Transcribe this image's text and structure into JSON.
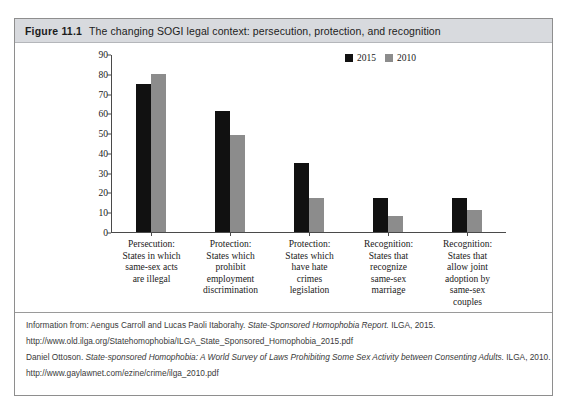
{
  "figure": {
    "number": "Figure 11.1",
    "title": "The changing SOGI legal context: persecution, protection, and recognition"
  },
  "chart_data": {
    "type": "bar",
    "title": "The changing SOGI legal context: persecution, protection, and recognition",
    "xlabel": "",
    "ylabel": "",
    "ylim": [
      0,
      90
    ],
    "yticks": [
      0,
      10,
      20,
      30,
      40,
      50,
      60,
      70,
      80,
      90
    ],
    "grid": false,
    "legend_position": "top-right",
    "categories": [
      "Persecution: States in which same-sex acts are illegal",
      "Protection: States which prohibit employment discrimination",
      "Protection: States which have hate crimes legislation",
      "Recognition: States that recognize same-sex marriage",
      "Recognition: States that allow joint adoption by same-sex couples"
    ],
    "category_lines": [
      [
        "Persecution:",
        "States in which",
        "same-sex acts",
        "are illegal"
      ],
      [
        "Protection:",
        "States which",
        "prohibit",
        "employment",
        "discrimination"
      ],
      [
        "Protection:",
        "States which",
        "have hate",
        "crimes",
        "legislation"
      ],
      [
        "Recognition:",
        "States that",
        "recognize",
        "same-sex",
        "marriage"
      ],
      [
        "Recognition:",
        "States that",
        "allow joint",
        "adoption by",
        "same-sex",
        "couples"
      ]
    ],
    "series": [
      {
        "name": "2015",
        "color": "#111111",
        "values": [
          75,
          61,
          35,
          17,
          17
        ]
      },
      {
        "name": "2010",
        "color": "#8c8c8c",
        "values": [
          80,
          49,
          17,
          8,
          11
        ]
      }
    ]
  },
  "footnotes": [
    "Information from: Aengus Carroll and Lucas Paoli Itaborahy. State-Sponsored Homophobia Report. ILGA, 2015.",
    "http://www.old.ilga.org/Statehomophobia/ILGA_State_Sponsored_Homophobia_2015.pdf",
    "Daniel Ottoson. State-sponsored Homophobia: A World Survey of Laws Prohibiting Some Sex Activity between Consenting Adults. ILGA, 2010.",
    "http://www.gaylawnet.com/ezine/crime/ilga_2010.pdf"
  ]
}
